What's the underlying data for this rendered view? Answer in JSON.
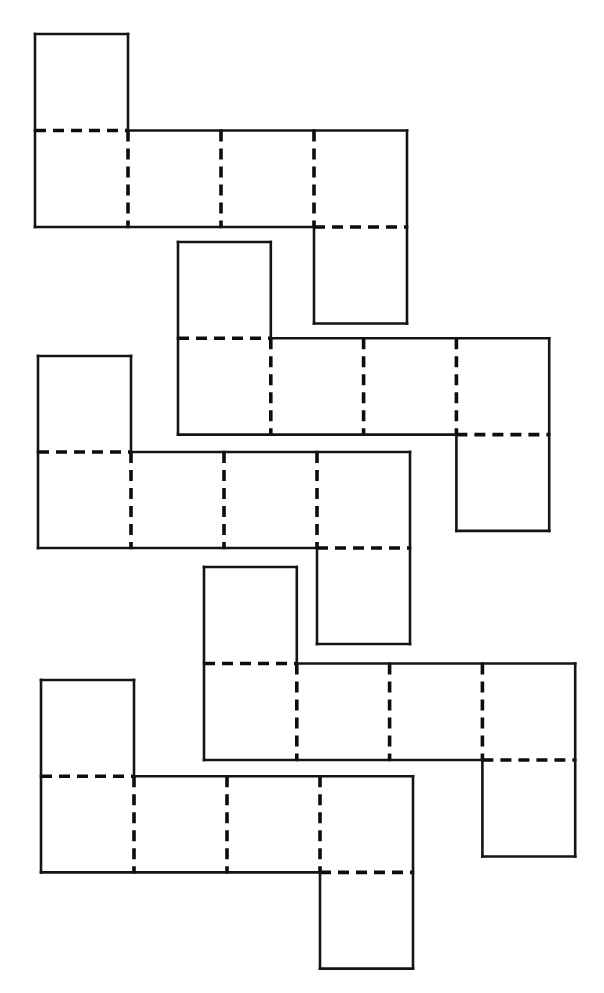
{
  "figure": {
    "net_count": 5,
    "line_styles": {
      "cut_edge": "solid",
      "fold_edge": "dashed",
      "color": "#111111"
    },
    "net_shape": {
      "squares": [
        {
          "col": 0,
          "row": 0
        },
        {
          "col": 0,
          "row": 1
        },
        {
          "col": 1,
          "row": 1
        },
        {
          "col": 2,
          "row": 1
        },
        {
          "col": 3,
          "row": 1
        },
        {
          "col": 3,
          "row": 2
        }
      ],
      "folds": [
        {
          "between": [
            [
              0,
              0
            ],
            [
              0,
              1
            ]
          ]
        },
        {
          "between": [
            [
              0,
              1
            ],
            [
              1,
              1
            ]
          ]
        },
        {
          "between": [
            [
              1,
              1
            ],
            [
              2,
              1
            ]
          ]
        },
        {
          "between": [
            [
              2,
              1
            ],
            [
              3,
              1
            ]
          ]
        },
        {
          "between": [
            [
              3,
              1
            ],
            [
              3,
              2
            ]
          ]
        }
      ]
    },
    "nets": [
      {
        "id": "net-1",
        "label": ""
      },
      {
        "id": "net-2",
        "label": ""
      },
      {
        "id": "net-3",
        "label": ""
      },
      {
        "id": "net-4",
        "label": ""
      },
      {
        "id": "net-5",
        "label": ""
      }
    ]
  }
}
